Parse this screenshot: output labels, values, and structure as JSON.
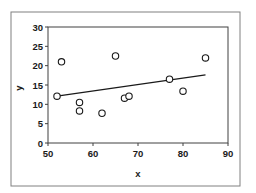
{
  "chart_data": {
    "type": "scatter",
    "title": "",
    "xlabel": "x",
    "ylabel": "y",
    "xlim": [
      50,
      90
    ],
    "ylim": [
      0,
      30
    ],
    "xticks": [
      50,
      60,
      70,
      80,
      90
    ],
    "yticks": [
      0,
      5,
      10,
      15,
      20,
      25,
      30
    ],
    "grid": false,
    "legend": null,
    "series": [
      {
        "name": "observations",
        "marker": "open-circle",
        "points": [
          {
            "x": 52,
            "y": 12.1
          },
          {
            "x": 53,
            "y": 21
          },
          {
            "x": 57,
            "y": 10.5
          },
          {
            "x": 57,
            "y": 8.3
          },
          {
            "x": 62,
            "y": 7.7
          },
          {
            "x": 65,
            "y": 22.5
          },
          {
            "x": 67,
            "y": 11.6
          },
          {
            "x": 68,
            "y": 12.1
          },
          {
            "x": 77,
            "y": 16.5
          },
          {
            "x": 80,
            "y": 13.4
          },
          {
            "x": 85,
            "y": 22
          }
        ]
      },
      {
        "name": "trend line",
        "type": "line",
        "points": [
          {
            "x": 52,
            "y": 12.1
          },
          {
            "x": 85,
            "y": 17.6
          }
        ]
      }
    ],
    "colors": {
      "frame": "#808080",
      "plot_border": "#404040",
      "marker": "#1a1a1a",
      "line": "#1a1a1a",
      "background": "#ffffff"
    }
  }
}
